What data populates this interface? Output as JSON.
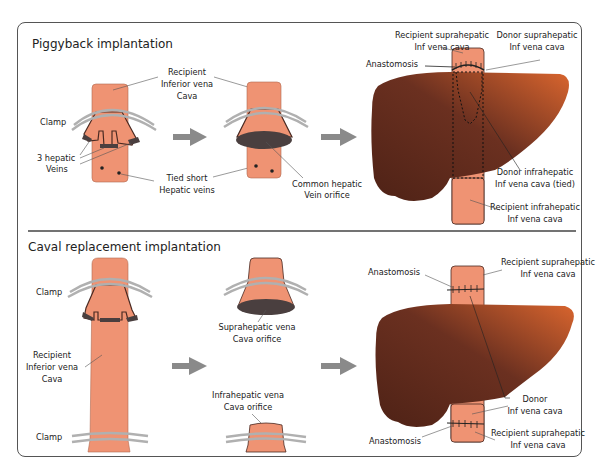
{
  "sections": {
    "piggyback": {
      "title": "Piggyback implantation",
      "labels": {
        "recipient_ivc": [
          "Recipient",
          "Inferior vena",
          "Cava"
        ],
        "clamp": "Clamp",
        "hepatic_veins": [
          "3 hepatic",
          "Veins"
        ],
        "tied_short": [
          "Tied short",
          "Hepatic veins"
        ],
        "common_orifice": [
          "Common hepatic",
          "Vein orifice"
        ],
        "recipient_suprahepatic": [
          "Recipient suprahepatic",
          "Inf vena cava"
        ],
        "donor_suprahepatic": [
          "Donor suprahepatic",
          "Inf vena cava"
        ],
        "anastomosis": "Anastomosis",
        "donor_infrahepatic": [
          "Donor infrahepatic",
          "Inf vena cava (tied)"
        ],
        "recipient_infrahepatic": [
          "Recipient infrahepatic",
          "Inf vena cava"
        ]
      }
    },
    "caval": {
      "title": "Caval replacement implantation",
      "labels": {
        "clamp_top": "Clamp",
        "clamp_bottom": "Clamp",
        "recipient_ivc": [
          "Recipient",
          "Inferior vena",
          "Cava"
        ],
        "suprahepatic_orifice": [
          "Suprahepatic vena",
          "Cava orifice"
        ],
        "infrahepatic_orifice": [
          "Infrahepatic vena",
          "Cava orifice"
        ],
        "anastomosis_top": "Anastomosis",
        "recipient_suprahepatic_top": [
          "Recipient suprahepatic",
          "Inf vena cava"
        ],
        "donor_ivc": [
          "Donor",
          "Inf vena cava"
        ],
        "anastomosis_bottom": "Anastomosis",
        "recipient_suprahepatic_bottom": [
          "Recipient suprahepatic",
          "Inf vena cava"
        ]
      }
    }
  },
  "colors": {
    "vessel": "#ef9373",
    "vessel_outline": "#4a2a22",
    "orifice": "#4a3f3f",
    "clamp": "#b0b0b0",
    "arrow": "#8a8a8a",
    "liver_dark": "#5a2a1c",
    "liver_light": "#c4572a",
    "text": "#222222"
  }
}
